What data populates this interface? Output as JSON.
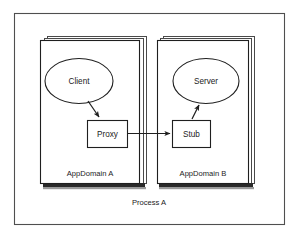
{
  "diagram": {
    "outer_container": {
      "label": "Process A",
      "label_position": "bottom-center"
    },
    "containers": [
      {
        "id": "appdomain-a",
        "label": "AppDomain A",
        "style": "stacked-pages",
        "x": 40,
        "y": 40,
        "width": 106,
        "height": 147
      },
      {
        "id": "appdomain-b",
        "label": "AppDomain B",
        "style": "stacked-pages",
        "x": 157,
        "y": 40,
        "width": 91,
        "height": 147
      }
    ],
    "nodes": [
      {
        "id": "client",
        "label": "Client",
        "shape": "ellipse",
        "cx": 79,
        "cy": 81,
        "rx": 34,
        "ry": 22,
        "container": "appdomain-a"
      },
      {
        "id": "proxy",
        "label": "Proxy",
        "shape": "rectangle",
        "x": 87,
        "y": 120,
        "width": 40,
        "height": 27,
        "container": "appdomain-a"
      },
      {
        "id": "server",
        "label": "Server",
        "shape": "ellipse",
        "cx": 206,
        "cy": 81,
        "rx": 33,
        "ry": 22,
        "container": "appdomain-b"
      },
      {
        "id": "stub",
        "label": "Stub",
        "shape": "rectangle",
        "x": 172,
        "y": 120,
        "width": 38,
        "height": 27,
        "container": "appdomain-b"
      }
    ],
    "connectors": [
      {
        "id": "client-to-proxy",
        "from": "client",
        "to": "proxy",
        "label": "",
        "arrowhead": "filled",
        "direction": "down-right"
      },
      {
        "id": "proxy-to-stub",
        "from": "proxy",
        "to": "stub",
        "label": "",
        "arrowhead": "filled",
        "direction": "right"
      },
      {
        "id": "stub-to-server",
        "from": "stub",
        "to": "server",
        "label": "",
        "arrowhead": "filled",
        "direction": "up-right"
      }
    ],
    "colors": {
      "background": "#ffffff",
      "stroke": "#1f1f1f",
      "frame_stroke": "#4f4f4f",
      "text": "#1b1b1b",
      "shadow": "#2a2a2a"
    }
  }
}
